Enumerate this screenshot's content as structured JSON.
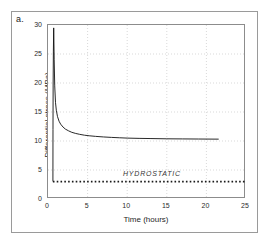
{
  "panel": {
    "label": "a."
  },
  "chart_data": {
    "type": "line",
    "title": "",
    "xlabel": "Time (hours)",
    "ylabel": "Differential stress (MPa)",
    "xlim": [
      0,
      25
    ],
    "ylim": [
      0,
      30
    ],
    "xticks": [
      0,
      5,
      10,
      15,
      20,
      25
    ],
    "yticks": [
      0,
      5,
      10,
      15,
      20,
      25,
      30
    ],
    "xtick_labels": [
      "0",
      "5",
      "10",
      "15",
      "20",
      "25"
    ],
    "ytick_labels": [
      "0",
      "5",
      "10",
      "15",
      "20",
      "25",
      "30"
    ],
    "grid": true,
    "grid_style": "dotted",
    "legend": "none",
    "series": [
      {
        "name": "Differential stress",
        "type": "line",
        "color": "#111111",
        "x": [
          0.62,
          0.63,
          0.65,
          0.68,
          0.72,
          0.78,
          0.85,
          0.95,
          1.05,
          1.2,
          1.4,
          1.6,
          1.9,
          2.2,
          2.6,
          3.0,
          3.5,
          4.0,
          4.6,
          5.2,
          6.0,
          7.0,
          8.0,
          9.0,
          10.0,
          11.5,
          13.0,
          15.0,
          17.0,
          19.0,
          21.5
        ],
        "y": [
          3.1,
          12.0,
          20.0,
          25.5,
          29.5,
          24.0,
          19.5,
          16.6,
          15.3,
          14.2,
          13.4,
          12.9,
          12.4,
          12.05,
          11.75,
          11.5,
          11.3,
          11.15,
          11.0,
          10.9,
          10.8,
          10.7,
          10.62,
          10.56,
          10.5,
          10.45,
          10.42,
          10.38,
          10.36,
          10.34,
          10.32
        ]
      },
      {
        "name": "HYDROSTATIC",
        "type": "dotted-line",
        "color": "#1a1a1a",
        "value": 3.0,
        "x_start": 0.62,
        "x_end": 25.0,
        "annotation": "HYDROSTATIC",
        "annotation_x": 13.0,
        "annotation_y": 4.3
      }
    ]
  }
}
